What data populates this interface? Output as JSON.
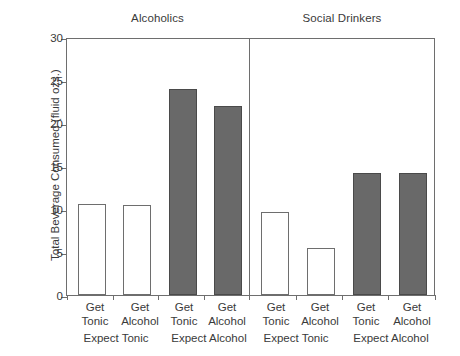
{
  "chart_data": {
    "type": "bar",
    "title": "",
    "xlabel": "",
    "ylabel": "Total Beverage Consumed (fluid ozs.)",
    "ylim": [
      0,
      30
    ],
    "yticks": [
      0,
      5,
      10,
      15,
      20,
      25,
      30
    ],
    "ytick_labels": [
      "0",
      "5",
      "10",
      "15",
      "20",
      "25",
      "30"
    ],
    "grid": false,
    "legend": "none",
    "panels": [
      {
        "title": "Alcoholics",
        "groups": [
          {
            "label": "Expect Tonic",
            "bars": [
              {
                "label_line1": "Get",
                "label_line2": "Tonic",
                "value": 10.6,
                "fill": "open"
              },
              {
                "label_line1": "Get",
                "label_line2": "Alcohol",
                "value": 10.5,
                "fill": "open"
              }
            ]
          },
          {
            "label": "Expect Alcohol",
            "bars": [
              {
                "label_line1": "Get",
                "label_line2": "Tonic",
                "value": 24.0,
                "fill": "solid"
              },
              {
                "label_line1": "Get",
                "label_line2": "Alcohol",
                "value": 22.0,
                "fill": "solid"
              }
            ]
          }
        ]
      },
      {
        "title": "Social Drinkers",
        "groups": [
          {
            "label": "Expect Tonic",
            "bars": [
              {
                "label_line1": "Get",
                "label_line2": "Tonic",
                "value": 9.7,
                "fill": "open"
              },
              {
                "label_line1": "Get",
                "label_line2": "Alcohol",
                "value": 5.5,
                "fill": "open"
              }
            ]
          },
          {
            "label": "Expect Alcohol",
            "bars": [
              {
                "label_line1": "Get",
                "label_line2": "Tonic",
                "value": 14.2,
                "fill": "solid"
              },
              {
                "label_line1": "Get",
                "label_line2": "Alcohol",
                "value": 14.2,
                "fill": "solid"
              }
            ]
          }
        ]
      }
    ],
    "categories": [
      "Alcoholics / Expect Tonic / Get Tonic",
      "Alcoholics / Expect Tonic / Get Alcohol",
      "Alcoholics / Expect Alcohol / Get Tonic",
      "Alcoholics / Expect Alcohol / Get Alcohol",
      "Social Drinkers / Expect Tonic / Get Tonic",
      "Social Drinkers / Expect Tonic / Get Alcohol",
      "Social Drinkers / Expect Alcohol / Get Tonic",
      "Social Drinkers / Expect Alcohol / Get Alcohol"
    ],
    "values": [
      10.6,
      10.5,
      24.0,
      22.0,
      9.7,
      5.5,
      14.2,
      14.2
    ],
    "colors": {
      "open_fill": "#ffffff",
      "solid_fill": "#696969",
      "axis": "#6e6e6e",
      "text": "#3a3a3a"
    }
  },
  "panel_titles": {
    "left": "Alcoholics",
    "right": "Social Drinkers"
  },
  "axis": {
    "y_title": "Total Beverage Consumed (fluid ozs.)",
    "tick_0": "0",
    "tick_5": "5",
    "tick_10": "10",
    "tick_15": "15",
    "tick_20": "20",
    "tick_25": "25",
    "tick_30": "30"
  },
  "x_labels": {
    "b0_l1": "Get",
    "b0_l2": "Tonic",
    "b1_l1": "Get",
    "b1_l2": "Alcohol",
    "b2_l1": "Get",
    "b2_l2": "Tonic",
    "b3_l1": "Get",
    "b3_l2": "Alcohol",
    "b4_l1": "Get",
    "b4_l2": "Tonic",
    "b5_l1": "Get",
    "b5_l2": "Alcohol",
    "b6_l1": "Get",
    "b6_l2": "Tonic",
    "b7_l1": "Get",
    "b7_l2": "Alcohol"
  },
  "group_labels": {
    "g0": "Expect Tonic",
    "g1": "Expect Alcohol",
    "g2": "Expect Tonic",
    "g3": "Expect Alcohol"
  }
}
